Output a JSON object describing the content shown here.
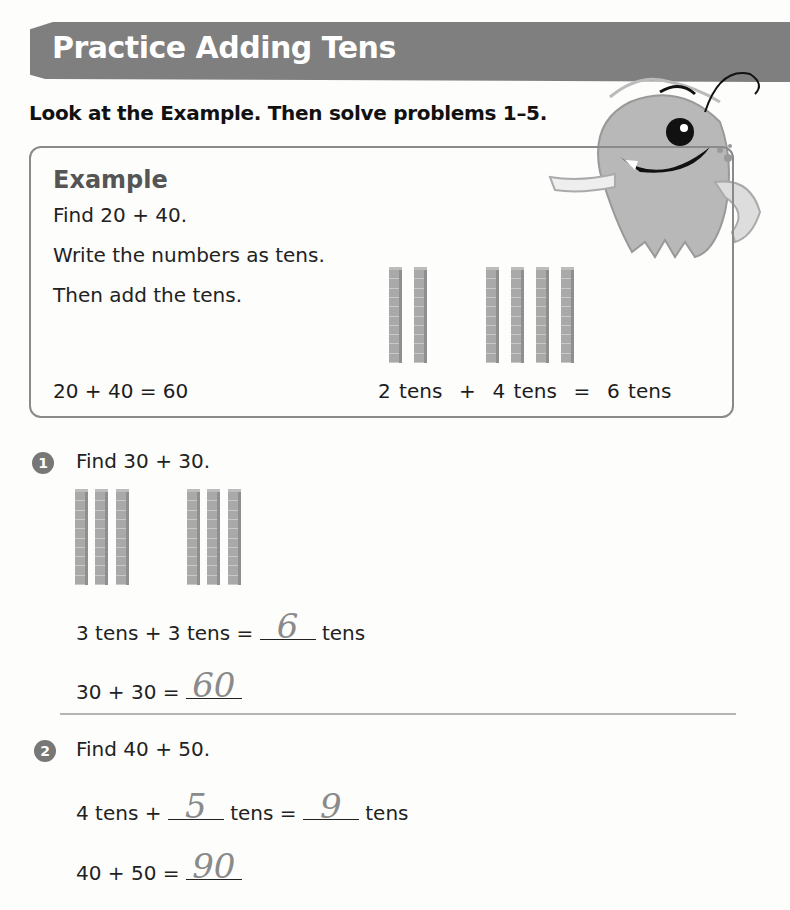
{
  "header": {
    "title": "Practice Adding Tens",
    "banner_color": "#7f7f7f"
  },
  "instructions": "Look at the Example. Then solve problems 1–5.",
  "example": {
    "heading": "Example",
    "lines": [
      "Find 20 + 40.",
      "Write the numbers as tens.",
      "Then add the tens."
    ],
    "equation_numbers": "20 + 40 = 60",
    "equation_tens": "2 tens  +  4 tens  =  6 tens",
    "rods_group1": 2,
    "rods_group2": 4
  },
  "problems": [
    {
      "number": "1",
      "prompt": "Find 30 + 30.",
      "rods_group1": 3,
      "rods_group2": 3,
      "line1_prefix": "3 tens + 3 tens =",
      "line1_answer": "6",
      "line1_suffix": "tens",
      "line2_prefix": "30 + 30 =",
      "line2_answer": "60"
    },
    {
      "number": "2",
      "prompt": "Find 40 + 50.",
      "line1_prefix": "4 tens +",
      "line1_answer_a": "5",
      "line1_mid": "tens =",
      "line1_answer_b": "9",
      "line1_suffix": "tens",
      "line2_prefix": "40 + 50 =",
      "line2_answer": "90"
    }
  ],
  "mascot": "one-eyed-monster-illustration"
}
